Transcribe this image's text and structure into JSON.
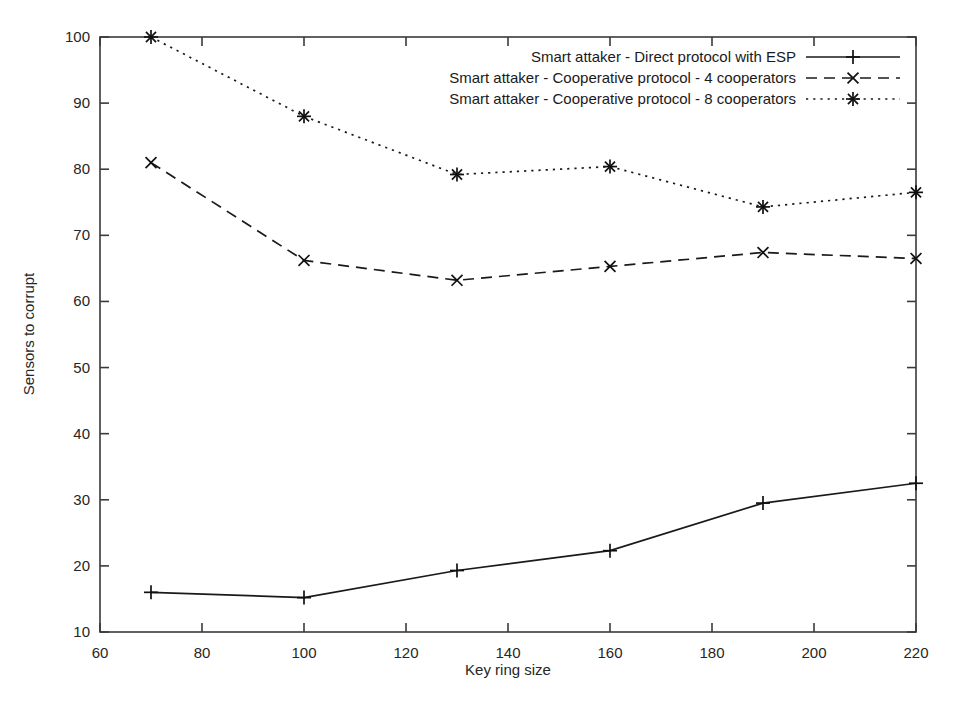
{
  "chart_data": {
    "type": "line",
    "title": "",
    "xlabel": "Key ring size",
    "ylabel": "Sensors to corrupt",
    "xlim": [
      60,
      220
    ],
    "ylim": [
      10,
      100
    ],
    "xticks": [
      60,
      80,
      100,
      120,
      140,
      160,
      180,
      200,
      220
    ],
    "yticks": [
      10,
      20,
      30,
      40,
      50,
      60,
      70,
      80,
      90,
      100
    ],
    "grid": false,
    "legend_position": "top-right-inside",
    "x": [
      70,
      100,
      130,
      160,
      190,
      220
    ],
    "series": [
      {
        "name": "Smart attaker - Direct protocol with ESP",
        "marker": "plus",
        "dash": "solid",
        "values": [
          16.0,
          15.2,
          19.3,
          22.3,
          29.5,
          32.5
        ]
      },
      {
        "name": "Smart attaker - Cooperative protocol - 4 cooperators",
        "marker": "cross",
        "dash": "dashed",
        "values": [
          81.0,
          66.2,
          63.2,
          65.3,
          67.4,
          66.5
        ]
      },
      {
        "name": "Smart attaker - Cooperative protocol - 8 cooperators",
        "marker": "star",
        "dash": "dotted",
        "values": [
          100.0,
          88.0,
          79.2,
          80.4,
          74.3,
          76.5
        ]
      }
    ],
    "colors": {
      "axis": "#3a3a3a",
      "series": "#1a1a1a",
      "background": "#ffffff"
    }
  }
}
